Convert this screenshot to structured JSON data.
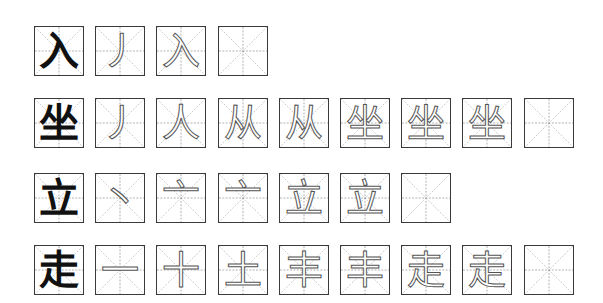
{
  "worksheet": {
    "rows": [
      {
        "character": "入",
        "steps": [
          "丿",
          "入"
        ],
        "empty_boxes": 1
      },
      {
        "character": "坐",
        "steps": [
          "丿",
          "人",
          "从",
          "从",
          "坐",
          "坐",
          "坐"
        ],
        "empty_boxes": 1
      },
      {
        "character": "立",
        "steps": [
          "丶",
          "亠",
          "亠",
          "立",
          "立"
        ],
        "empty_boxes": 1
      },
      {
        "character": "走",
        "steps": [
          "一",
          "十",
          "土",
          "丰",
          "丰",
          "走",
          "走"
        ],
        "empty_boxes": 1
      }
    ],
    "colors": {
      "box_border": "#3a3a3a",
      "guide_line": "#9a9a9a",
      "model_char": "#111111",
      "outline_char": "#555555"
    }
  }
}
